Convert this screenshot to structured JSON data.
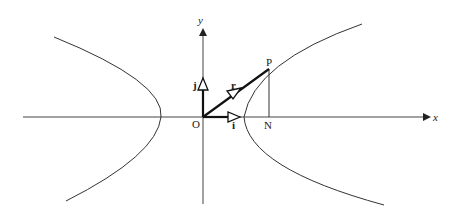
{
  "diagram": {
    "colors": {
      "stroke": "#222222",
      "background": "#ffffff"
    },
    "axes": {
      "x_label": "x",
      "y_label": "y",
      "origin_label": "O"
    },
    "unit_vectors": {
      "i_label": "i",
      "j_label": "j"
    },
    "position_vector": {
      "label": "r",
      "point_label": "P",
      "foot_label": "N"
    }
  }
}
